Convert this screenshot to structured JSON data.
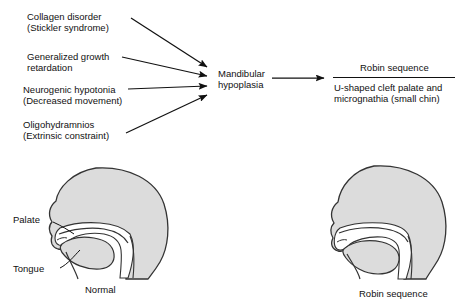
{
  "diagram": {
    "causes": [
      {
        "id": "collagen-disorder",
        "line1": "Collagen disorder",
        "line2": "(Stickler syndrome)"
      },
      {
        "id": "generalized-growth-retardation",
        "line1": "Generalized growth",
        "line2": "retardation"
      },
      {
        "id": "neurogenic-hypotonia",
        "line1": "Neurogenic hypotonia",
        "line2": "(Decreased movement)"
      },
      {
        "id": "oligohydramnios",
        "line1": "Oligohydramnios",
        "line2": "(Extrinsic constraint)"
      }
    ],
    "mechanism": {
      "line1": "Mandibular",
      "line2": "hypoplasia"
    },
    "outcome": {
      "heading": "Robin sequence",
      "line1": "U-shaped cleft palate and",
      "line2": "micrognathia (small chin)"
    },
    "figures": [
      {
        "id": "normal-head",
        "caption": "Normal",
        "labels": [
          {
            "id": "palate",
            "text": "Palate"
          },
          {
            "id": "tongue",
            "text": "Tongue"
          }
        ]
      },
      {
        "id": "robin-head",
        "caption": "Robin sequence",
        "labels": []
      }
    ],
    "colors": {
      "ink": "#111111",
      "head_fill": "#dcdcdc",
      "head_stroke": "#333333",
      "cavity_fill": "#ffffff",
      "background": "#ffffff"
    }
  }
}
